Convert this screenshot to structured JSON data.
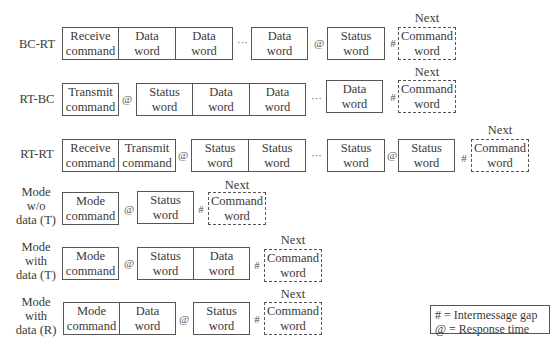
{
  "diagram": {
    "rows": [
      {
        "label": "BC-RT",
        "items": [
          {
            "type": "box",
            "text1": "Receive",
            "text2": "command"
          },
          {
            "type": "box",
            "text1": "Data",
            "text2": "word"
          },
          {
            "type": "box",
            "text1": "Data",
            "text2": "word"
          },
          {
            "type": "ellipsis",
            "text": "···"
          },
          {
            "type": "box",
            "text1": "Data",
            "text2": "word"
          },
          {
            "type": "symbol",
            "text": "@"
          },
          {
            "type": "box",
            "text1": "Status",
            "text2": "word"
          },
          {
            "type": "symbol",
            "text": "#"
          },
          {
            "type": "next",
            "caption": "Next",
            "text1": "Command",
            "text2": "word"
          }
        ]
      },
      {
        "label": "RT-BC",
        "items": [
          {
            "type": "box",
            "text1": "Transmit",
            "text2": "command"
          },
          {
            "type": "symbol",
            "text": "@"
          },
          {
            "type": "box",
            "text1": "Status",
            "text2": "word"
          },
          {
            "type": "box",
            "text1": "Data",
            "text2": "word"
          },
          {
            "type": "box",
            "text1": "Data",
            "text2": "word"
          },
          {
            "type": "ellipsis",
            "text": "···"
          },
          {
            "type": "box",
            "text1": "Data",
            "text2": "word"
          },
          {
            "type": "symbol",
            "text": "#"
          },
          {
            "type": "next",
            "caption": "Next",
            "text1": "Command",
            "text2": "word"
          }
        ]
      },
      {
        "label": "RT-RT",
        "items": [
          {
            "type": "box",
            "text1": "Receive",
            "text2": "command"
          },
          {
            "type": "box",
            "text1": "Transmit",
            "text2": "command"
          },
          {
            "type": "symbol",
            "text": "@"
          },
          {
            "type": "box",
            "text1": "Status",
            "text2": "word"
          },
          {
            "type": "box",
            "text1": "Status",
            "text2": "word"
          },
          {
            "type": "ellipsis",
            "text": "···"
          },
          {
            "type": "box",
            "text1": "Status",
            "text2": "word"
          },
          {
            "type": "symbol",
            "text": "@"
          },
          {
            "type": "box",
            "text1": "Status",
            "text2": "word"
          },
          {
            "type": "symbol",
            "text": "#"
          },
          {
            "type": "next",
            "caption": "Next",
            "text1": "Command",
            "text2": "word"
          }
        ]
      },
      {
        "label1": "Mode",
        "label2": "w/o",
        "label3": "data (T)",
        "items": [
          {
            "type": "box",
            "text1": "Mode",
            "text2": "command"
          },
          {
            "type": "symbol",
            "text": "@"
          },
          {
            "type": "box",
            "text1": "Status",
            "text2": "word"
          },
          {
            "type": "symbol",
            "text": "#"
          },
          {
            "type": "next",
            "caption": "Next",
            "text1": "Command",
            "text2": "word"
          }
        ]
      },
      {
        "label1": "Mode",
        "label2": "with",
        "label3": "data (T)",
        "items": [
          {
            "type": "box",
            "text1": "Mode",
            "text2": "command"
          },
          {
            "type": "symbol",
            "text": "@"
          },
          {
            "type": "box",
            "text1": "Status",
            "text2": "word"
          },
          {
            "type": "box",
            "text1": "Data",
            "text2": "word"
          },
          {
            "type": "symbol",
            "text": "#"
          },
          {
            "type": "next",
            "caption": "Next",
            "text1": "Command",
            "text2": "word"
          }
        ]
      },
      {
        "label1": "Mode",
        "label2": "with",
        "label3": "data (R)",
        "items": [
          {
            "type": "box",
            "text1": "Mode",
            "text2": "command"
          },
          {
            "type": "box",
            "text1": "Data",
            "text2": "word"
          },
          {
            "type": "symbol",
            "text": "@"
          },
          {
            "type": "box",
            "text1": "Status",
            "text2": "word"
          },
          {
            "type": "symbol",
            "text": "#"
          },
          {
            "type": "next",
            "caption": "Next",
            "text1": "Command",
            "text2": "word"
          }
        ]
      }
    ],
    "legend": {
      "line1": "# = Intermessage gap",
      "line2": "@ = Response time"
    }
  }
}
